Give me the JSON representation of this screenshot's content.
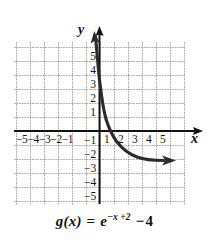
{
  "figure": {
    "name": "exponential-decay-graph",
    "caption_parts": {
      "function_name": "g",
      "variable": "(x)",
      "equals": "=",
      "base": "e",
      "exponent": "−x +2",
      "minus": "−",
      "constant": "4"
    },
    "caption_plain": "g(x) = e^(-x+2) - 4"
  },
  "axes": {
    "x_label": "x",
    "y_label": "y",
    "x_ticks_negative": [
      "−5",
      "−4",
      "−3",
      "−2",
      "−1"
    ],
    "x_ticks_positive": [
      "1",
      "2",
      "3",
      "4",
      "5"
    ],
    "y_ticks_positive": [
      "5",
      "4",
      "3",
      "2",
      "1"
    ],
    "y_ticks_negative": [
      "1",
      "2",
      "3",
      "4",
      "5"
    ],
    "y_ticks_negative_display": [
      "−1",
      "−2",
      "−3",
      "−4",
      "−5"
    ],
    "axis_color": "#111111",
    "grid_color": "#8d8d8d",
    "background": "#ffffff"
  },
  "chart_data": {
    "type": "line",
    "title": "",
    "subtitle": "",
    "xlabel": "x",
    "ylabel": "y",
    "xlim": [
      -6.1,
      6.2
    ],
    "ylim": [
      -6.4,
      5.4
    ],
    "grid": true,
    "legend": "none",
    "equation": "g(x) = e^(-x+2) - 4",
    "asymptote": {
      "type": "horizontal",
      "y": -4
    },
    "x_intercept": 0.614,
    "y_intercept": 3.389,
    "arrow_heads": [
      "up-left-end",
      "right-end"
    ],
    "series": [
      {
        "name": "g(x) = e^(-x+2) - 4",
        "color": "#2b2b2b",
        "x": [
          -0.55,
          -0.4,
          -0.2,
          0.0,
          0.2,
          0.4,
          0.6,
          0.8,
          1.0,
          1.2,
          1.4,
          1.6,
          1.8,
          2.0,
          2.25,
          2.5,
          2.75,
          3.0,
          3.5,
          4.0,
          4.5,
          5.0,
          5.5,
          6.0
        ],
        "y": [
          8.82,
          7.06,
          5.05,
          3.39,
          2.01,
          0.86,
          -0.09,
          -0.88,
          -1.53,
          -2.07,
          -2.51,
          -2.88,
          -3.18,
          -3.43,
          -3.68,
          -3.84,
          -3.95,
          -4.03,
          -4.18,
          -4.26,
          -4.3,
          -4.32,
          -4.33,
          -4.33
        ]
      }
    ],
    "note": "values are pixel-fit samples of the drawn exponential decay curve"
  }
}
